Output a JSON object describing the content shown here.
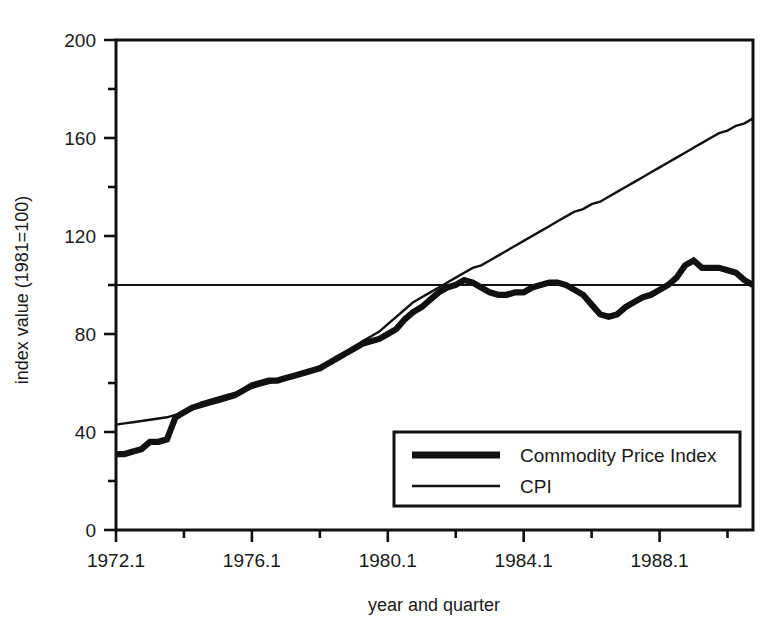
{
  "chart_data": {
    "type": "line",
    "title": "",
    "xlabel": "year and quarter",
    "ylabel": "index value (1981=100)",
    "xlim": [
      1972.0,
      1990.75
    ],
    "ylim": [
      0,
      200
    ],
    "grid": false,
    "legend_position": "bottom-right",
    "reference_lines": [
      {
        "axis": "y",
        "value": 100,
        "label": "",
        "style": "thin-solid"
      }
    ],
    "x_tick_labels": [
      "1972.1",
      "1976.1",
      "1980.1",
      "1984.1",
      "1988.1"
    ],
    "x_tick_values": [
      1972.0,
      1976.0,
      1980.0,
      1984.0,
      1988.0
    ],
    "x_minor_tick_values": [
      1974.0,
      1978.0,
      1982.0,
      1986.0,
      1990.0
    ],
    "y_tick_labels": [
      "0",
      "40",
      "80",
      "120",
      "160",
      "200"
    ],
    "y_tick_values": [
      0,
      40,
      80,
      120,
      160,
      200
    ],
    "y_minor_tick_values": [
      20,
      60,
      100,
      140,
      180
    ],
    "x": [
      1972.0,
      1972.25,
      1972.5,
      1972.75,
      1973.0,
      1973.25,
      1973.5,
      1973.75,
      1974.0,
      1974.25,
      1974.5,
      1974.75,
      1975.0,
      1975.25,
      1975.5,
      1975.75,
      1976.0,
      1976.25,
      1976.5,
      1976.75,
      1977.0,
      1977.25,
      1977.5,
      1977.75,
      1978.0,
      1978.25,
      1978.5,
      1978.75,
      1979.0,
      1979.25,
      1979.5,
      1979.75,
      1980.0,
      1980.25,
      1980.5,
      1980.75,
      1981.0,
      1981.25,
      1981.5,
      1981.75,
      1982.0,
      1982.25,
      1982.5,
      1982.75,
      1983.0,
      1983.25,
      1983.5,
      1983.75,
      1984.0,
      1984.25,
      1984.5,
      1984.75,
      1985.0,
      1985.25,
      1985.5,
      1985.75,
      1986.0,
      1986.25,
      1986.5,
      1986.75,
      1987.0,
      1987.25,
      1987.5,
      1987.75,
      1988.0,
      1988.25,
      1988.5,
      1988.75,
      1989.0,
      1989.25,
      1989.5,
      1989.75,
      1990.0,
      1990.25,
      1990.5,
      1990.75
    ],
    "series": [
      {
        "name": "Commodity Price Index",
        "style": "thick",
        "values": [
          31,
          31,
          32,
          33,
          36,
          36,
          37,
          46,
          48,
          50,
          51,
          52,
          53,
          54,
          55,
          57,
          59,
          60,
          61,
          61,
          62,
          63,
          64,
          65,
          66,
          68,
          70,
          72,
          74,
          76,
          77,
          78,
          80,
          82,
          86,
          89,
          91,
          94,
          97,
          99,
          100,
          102,
          101,
          99,
          97,
          96,
          96,
          97,
          97,
          99,
          100,
          101,
          101,
          100,
          98,
          96,
          92,
          88,
          87,
          88,
          91,
          93,
          95,
          96,
          98,
          100,
          103,
          108,
          110,
          107,
          107,
          107,
          106,
          105,
          102,
          100
        ]
      },
      {
        "name": "CPI",
        "style": "thin",
        "values": [
          43,
          43.5,
          44,
          44.5,
          45,
          45.5,
          46,
          47,
          48,
          50,
          52,
          53,
          54,
          55,
          56,
          57,
          58,
          59,
          60,
          61,
          62,
          63,
          64,
          65,
          66,
          68,
          70,
          72,
          74,
          77,
          79,
          81,
          84,
          87,
          90,
          93,
          95,
          97,
          99,
          101,
          103,
          105,
          107,
          108,
          110,
          112,
          114,
          116,
          118,
          120,
          122,
          124,
          126,
          128,
          130,
          131,
          133,
          134,
          136,
          138,
          140,
          142,
          144,
          146,
          148,
          150,
          152,
          154,
          156,
          158,
          160,
          162,
          163,
          165,
          166,
          168
        ]
      }
    ]
  },
  "legend": {
    "entries": [
      {
        "label": "Commodity Price Index",
        "style": "thick"
      },
      {
        "label": "CPI",
        "style": "thin"
      }
    ]
  },
  "axes": {
    "x_title": "year and quarter",
    "y_title": "index value (1981=100)"
  }
}
